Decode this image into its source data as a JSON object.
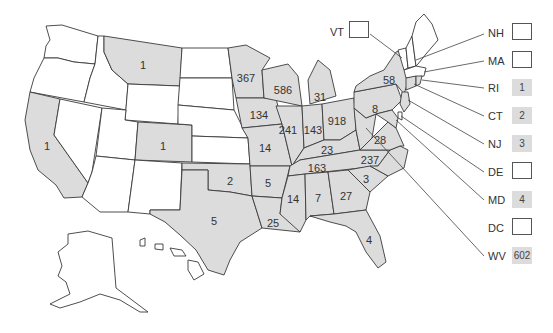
{
  "colors": {
    "filled": "#dcdcdc",
    "empty": "#ffffff",
    "border": "#3a3a3a"
  },
  "states": {
    "WA": {
      "value": null
    },
    "OR": {
      "value": null
    },
    "CA": {
      "value": "1"
    },
    "ID": {
      "value": null
    },
    "NV": {
      "value": null
    },
    "MT": {
      "value": "1"
    },
    "WY": {
      "value": null
    },
    "UT": {
      "value": null
    },
    "AZ": {
      "value": null
    },
    "CO": {
      "value": "1"
    },
    "NM": {
      "value": null
    },
    "ND": {
      "value": null
    },
    "SD": {
      "value": null
    },
    "NE": {
      "value": null
    },
    "KS": {
      "value": null
    },
    "OK": {
      "value": "2"
    },
    "TX": {
      "value": "5"
    },
    "MN": {
      "value": "367"
    },
    "IA": {
      "value": "134"
    },
    "MO": {
      "value": "14"
    },
    "AR": {
      "value": "5"
    },
    "LA": {
      "value": "25"
    },
    "WI": {
      "value": "586"
    },
    "IL": {
      "value": "241"
    },
    "MI": {
      "value": "31"
    },
    "IN": {
      "value": "143"
    },
    "OH": {
      "value": "918"
    },
    "KY": {
      "value": "23"
    },
    "TN": {
      "value": "163"
    },
    "MS": {
      "value": "14"
    },
    "AL": {
      "value": "7"
    },
    "GA": {
      "value": "27"
    },
    "FL": {
      "value": "4"
    },
    "SC": {
      "value": "3"
    },
    "NC": {
      "value": "237"
    },
    "VA": {
      "value": "28"
    },
    "PA": {
      "value": "8"
    },
    "NY": {
      "value": "58"
    },
    "ME": {
      "value": null
    },
    "AK": {
      "value": null
    },
    "HI": {
      "value": null
    }
  },
  "callouts": [
    {
      "abbr": "VT",
      "value": ""
    },
    {
      "abbr": "NH",
      "value": ""
    },
    {
      "abbr": "MA",
      "value": ""
    },
    {
      "abbr": "RI",
      "value": "1"
    },
    {
      "abbr": "CT",
      "value": "2"
    },
    {
      "abbr": "NJ",
      "value": "3"
    },
    {
      "abbr": "DE",
      "value": ""
    },
    {
      "abbr": "MD",
      "value": "4"
    },
    {
      "abbr": "DC",
      "value": ""
    },
    {
      "abbr": "WV",
      "value": "602"
    }
  ]
}
